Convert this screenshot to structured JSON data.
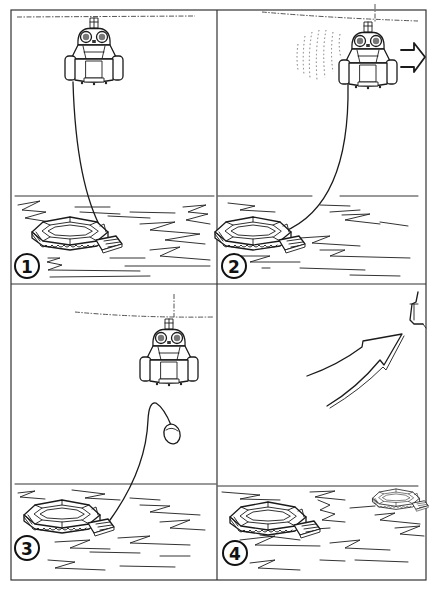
{
  "figure": {
    "layout": "2x2 step panels",
    "colors": {
      "ink": "#1b1b1b",
      "paper": "#ffffff"
    }
  },
  "panels": [
    {
      "number": "1",
      "scene": "helicopter hovering, cable lowered to life raft on water"
    },
    {
      "number": "2",
      "scene": "helicopter moving right while towing raft, arrow points right"
    },
    {
      "number": "3",
      "scene": "cable released from helicopter, rescue pod dropping"
    },
    {
      "number": "4",
      "scene": "helicopter departing upward-right, rafts drifting on water"
    }
  ]
}
